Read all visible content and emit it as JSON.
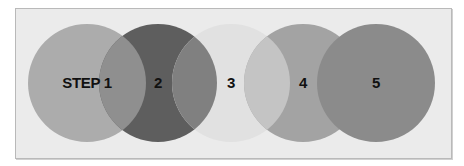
{
  "diagram": {
    "type": "overlapping-circles-process",
    "background": "#ebebeb",
    "border": "#b9b9b9",
    "steps": [
      {
        "label": "STEP 1",
        "cx": 87,
        "color": "#acacac"
      },
      {
        "label": "2",
        "cx": 158,
        "color": "#5e5e5e"
      },
      {
        "label": "3",
        "cx": 231,
        "color": "#e1e1e1"
      },
      {
        "label": "4",
        "cx": 303,
        "color": "#a3a3a3"
      },
      {
        "label": "5",
        "cx": 376,
        "color": "#8b8b8b"
      }
    ],
    "overlaps": [
      {
        "between": "1-2",
        "color": "#8f8f8f"
      },
      {
        "between": "2-3",
        "color": "#808080"
      },
      {
        "between": "3-4",
        "color": "#c4c4c4"
      }
    ],
    "radius": 59,
    "cy": 83
  }
}
